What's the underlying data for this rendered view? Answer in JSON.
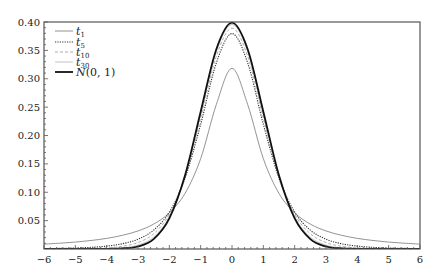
{
  "chart_data": {
    "type": "line",
    "title": "",
    "xlabel": "",
    "ylabel": "",
    "xlim": [
      -6,
      6
    ],
    "ylim": [
      0,
      0.4
    ],
    "grid": false,
    "legend_position": "upper-left",
    "x_ticks": [
      -6,
      -5,
      -4,
      -3,
      -2,
      -1,
      0,
      1,
      2,
      3,
      4,
      5,
      6
    ],
    "x_tick_labels": [
      "−6",
      "−5",
      "−4",
      "−3",
      "−2",
      "−1",
      "0",
      "1",
      "2",
      "3",
      "4",
      "5",
      "6"
    ],
    "y_ticks": [
      0.05,
      0.1,
      0.15,
      0.2,
      0.25,
      0.3,
      0.35,
      0.4
    ],
    "y_tick_labels": [
      "0.05",
      "0.10",
      "0.15",
      "0.20",
      "0.25",
      "0.30",
      "0.35",
      "0.40"
    ],
    "x": [
      -6,
      -5.5,
      -5,
      -4.5,
      -4,
      -3.5,
      -3,
      -2.5,
      -2,
      -1.5,
      -1,
      -0.5,
      0,
      0.5,
      1,
      1.5,
      2,
      2.5,
      3,
      3.5,
      4,
      4.5,
      5,
      5.5,
      6
    ],
    "series": [
      {
        "name": "t1",
        "label_main": "t",
        "label_sub": "1",
        "style": "thin-solid",
        "color": "#777777",
        "width": 0.8,
        "dash": "",
        "values": [
          0.0086,
          0.0102,
          0.0122,
          0.015,
          0.0187,
          0.0241,
          0.0318,
          0.0439,
          0.0637,
          0.0979,
          0.1592,
          0.2546,
          0.3183,
          0.2546,
          0.1592,
          0.0979,
          0.0637,
          0.0439,
          0.0318,
          0.0241,
          0.0187,
          0.015,
          0.0122,
          0.0102,
          0.0086
        ]
      },
      {
        "name": "t5",
        "label_main": "t",
        "label_sub": "5",
        "style": "dotted",
        "color": "#333333",
        "width": 1.1,
        "dash": "1.2 1.2",
        "values": [
          0.0007,
          0.0011,
          0.0018,
          0.0029,
          0.0051,
          0.0092,
          0.0173,
          0.0333,
          0.0651,
          0.1245,
          0.2197,
          0.3279,
          0.3796,
          0.3279,
          0.2197,
          0.1245,
          0.0651,
          0.0333,
          0.0173,
          0.0092,
          0.0051,
          0.0029,
          0.0018,
          0.0011,
          0.0007
        ]
      },
      {
        "name": "t10",
        "label_main": "t",
        "label_sub": "10",
        "style": "dashed",
        "color": "#999999",
        "width": 0.8,
        "dash": "3 2",
        "values": [
          0.0001,
          0.0002,
          0.0004,
          0.0009,
          0.002,
          0.0048,
          0.0114,
          0.0269,
          0.0611,
          0.1275,
          0.2304,
          0.3397,
          0.3891,
          0.3397,
          0.2304,
          0.1275,
          0.0611,
          0.0269,
          0.0114,
          0.0048,
          0.002,
          0.0009,
          0.0004,
          0.0002,
          0.0001
        ]
      },
      {
        "name": "t30",
        "label_main": "t",
        "label_sub": "30",
        "style": "thin-solid-light",
        "color": "#aaaaaa",
        "width": 0.7,
        "dash": "",
        "values": [
          0.0,
          0.0,
          0.0,
          0.0001,
          0.0005,
          0.002,
          0.0068,
          0.021,
          0.0569,
          0.129,
          0.238,
          0.3479,
          0.3956,
          0.3479,
          0.238,
          0.129,
          0.0569,
          0.021,
          0.0068,
          0.002,
          0.0005,
          0.0001,
          0.0,
          0.0,
          0.0
        ]
      },
      {
        "name": "N(0, 1)",
        "label_main": "N",
        "label_rest": "(0, 1)",
        "style": "thick-solid",
        "color": "#111111",
        "width": 1.8,
        "dash": "",
        "values": [
          0.0,
          0.0,
          0.0,
          0.0,
          0.0001,
          0.0009,
          0.0044,
          0.0175,
          0.054,
          0.1295,
          0.242,
          0.3521,
          0.3989,
          0.3521,
          0.242,
          0.1295,
          0.054,
          0.0175,
          0.0044,
          0.0009,
          0.0001,
          0.0,
          0.0,
          0.0,
          0.0
        ]
      }
    ]
  },
  "layout": {
    "plot_left": 44,
    "plot_right": 420,
    "plot_top": 22,
    "plot_bottom": 249,
    "axis_color": "#555555",
    "x_minor_step": 0.2,
    "y_minor_step": 0.01
  },
  "legend": {
    "x_line_start": 55,
    "x_line_end": 73,
    "x_text": 76,
    "rows_y": [
      31,
      42,
      52,
      62,
      72
    ]
  }
}
